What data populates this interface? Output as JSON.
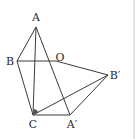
{
  "diagram": {
    "type": "geometry",
    "points": {
      "A": {
        "label": "A",
        "x": 36,
        "y": 27,
        "lx": 36,
        "ly": 21
      },
      "B": {
        "label": "B",
        "x": 17,
        "y": 61,
        "lx": 10,
        "ly": 65
      },
      "O": {
        "label": "O",
        "x": 56,
        "y": 61,
        "lx": 60,
        "ly": 61
      },
      "Bp": {
        "label": "B′",
        "x": 108,
        "y": 75,
        "lx": 115,
        "ly": 79
      },
      "C": {
        "label": "C",
        "x": 33,
        "y": 115,
        "lx": 33,
        "ly": 128
      },
      "Ap": {
        "label": "A′",
        "x": 70,
        "y": 115,
        "lx": 72,
        "ly": 128
      }
    },
    "segments": [
      [
        "A",
        "B"
      ],
      [
        "A",
        "C"
      ],
      [
        "A",
        "Ap"
      ],
      [
        "B",
        "O"
      ],
      [
        "B",
        "C"
      ],
      [
        "O",
        "Bp"
      ],
      [
        "C",
        "Bp"
      ],
      [
        "Bp",
        "Ap"
      ],
      [
        "C",
        "Ap"
      ]
    ],
    "angle_mark": {
      "vertex": "C",
      "fill": "#555555"
    }
  }
}
